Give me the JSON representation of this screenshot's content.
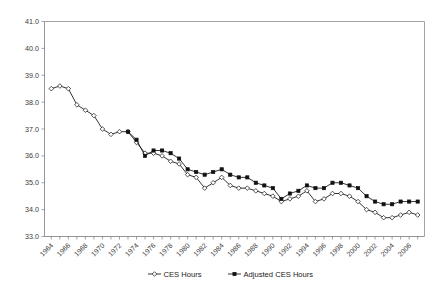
{
  "chart_data": {
    "type": "line",
    "title": "",
    "subtitle": "",
    "xlabel": "",
    "ylabel": "",
    "xlim": [
      1963.2,
      2007.8
    ],
    "ylim": [
      33.0,
      41.0
    ],
    "grid": false,
    "legend_position": "bottom-center",
    "y_ticks": [
      "41.0",
      "40.0",
      "39.0",
      "38.0",
      "37.0",
      "36.0",
      "35.0",
      "34.0",
      "33.0"
    ],
    "y_tick_values": [
      41.0,
      40.0,
      39.0,
      38.0,
      37.0,
      36.0,
      35.0,
      34.0,
      33.0
    ],
    "x_tick_labels": [
      "1964",
      "1966",
      "1968",
      "1970",
      "1972",
      "1974",
      "1976",
      "1978",
      "1980",
      "1982",
      "1984",
      "1986",
      "1988",
      "1990",
      "1992",
      "1994",
      "1996",
      "1998",
      "2000",
      "2002",
      "2004",
      "2006"
    ],
    "x_tick_values": [
      1964,
      1966,
      1968,
      1970,
      1972,
      1974,
      1976,
      1978,
      1980,
      1982,
      1984,
      1986,
      1988,
      1990,
      1992,
      1994,
      1996,
      1998,
      2000,
      2002,
      2004,
      2006
    ],
    "x_minor_step": 1,
    "series": [
      {
        "name": "CES Hours",
        "marker": "open-diamond",
        "marker_fill": "#ffffff",
        "marker_stroke": "#111111",
        "line_color": "#111111",
        "x": [
          1964,
          1965,
          1966,
          1967,
          1968,
          1969,
          1970,
          1971,
          1972,
          1973,
          1974,
          1975,
          1976,
          1977,
          1978,
          1979,
          1980,
          1981,
          1982,
          1983,
          1984,
          1985,
          1986,
          1987,
          1988,
          1989,
          1990,
          1991,
          1992,
          1993,
          1994,
          1995,
          1996,
          1997,
          1998,
          1999,
          2000,
          2001,
          2002,
          2003,
          2004,
          2005,
          2006,
          2007
        ],
        "values": [
          38.5,
          38.6,
          38.5,
          37.9,
          37.7,
          37.5,
          37.0,
          36.8,
          36.9,
          36.9,
          36.5,
          36.1,
          36.1,
          36.0,
          35.8,
          35.7,
          35.3,
          35.2,
          34.8,
          35.0,
          35.2,
          34.9,
          34.8,
          34.8,
          34.7,
          34.6,
          34.5,
          34.3,
          34.4,
          34.5,
          34.7,
          34.3,
          34.4,
          34.6,
          34.6,
          34.5,
          34.3,
          34.0,
          33.9,
          33.7,
          33.7,
          33.8,
          33.9,
          33.8
        ]
      },
      {
        "name": "Adjusted CES Hours",
        "marker": "filled-square",
        "marker_fill": "#111111",
        "marker_stroke": "#111111",
        "line_color": "#111111",
        "x": [
          1973,
          1974,
          1975,
          1976,
          1977,
          1978,
          1979,
          1980,
          1981,
          1982,
          1983,
          1984,
          1985,
          1986,
          1987,
          1988,
          1989,
          1990,
          1991,
          1992,
          1993,
          1994,
          1995,
          1996,
          1997,
          1998,
          1999,
          2000,
          2001,
          2002,
          2003,
          2004,
          2005,
          2006,
          2007
        ],
        "values": [
          36.9,
          36.6,
          36.0,
          36.2,
          36.2,
          36.1,
          35.9,
          35.5,
          35.4,
          35.3,
          35.4,
          35.5,
          35.3,
          35.2,
          35.2,
          35.0,
          34.9,
          34.8,
          34.4,
          34.6,
          34.7,
          34.9,
          34.8,
          34.8,
          35.0,
          35.0,
          34.9,
          34.8,
          34.5,
          34.3,
          34.2,
          34.2,
          34.3,
          34.3,
          34.3
        ]
      }
    ]
  },
  "legend": {
    "items": [
      {
        "label": "CES Hours",
        "marker": "open-diamond"
      },
      {
        "label": "Adjusted CES Hours",
        "marker": "filled-square"
      }
    ]
  },
  "colors": {
    "background": "#ffffff",
    "line": "#111111",
    "axis": "#8a8a8a",
    "tick_text": "#3a3a3a",
    "legend_text": "#1a1a1a"
  }
}
